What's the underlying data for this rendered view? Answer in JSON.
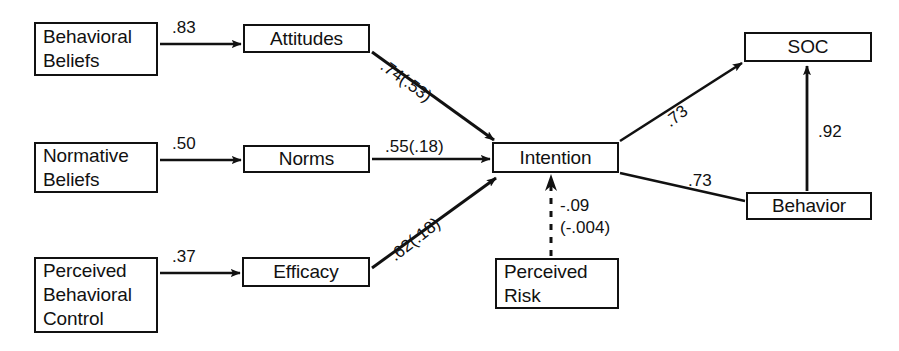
{
  "diagram": {
    "type": "path-diagram",
    "stroke_color": "#111111",
    "background_color": "#ffffff",
    "nodes": [
      {
        "id": "behavioral-beliefs",
        "lines": [
          "Behavioral",
          "Beliefs"
        ],
        "x": 34,
        "y": 22,
        "w": 124,
        "h": 54,
        "align": "left"
      },
      {
        "id": "normative-beliefs",
        "lines": [
          "Normative",
          "Beliefs"
        ],
        "x": 34,
        "y": 142,
        "w": 124,
        "h": 51,
        "align": "left"
      },
      {
        "id": "perceived-behavioral-control",
        "lines": [
          "Perceived",
          "Behavioral",
          "Control"
        ],
        "x": 34,
        "y": 257,
        "w": 124,
        "h": 76,
        "align": "left"
      },
      {
        "id": "attitudes",
        "lines": [
          "Attitudes"
        ],
        "x": 243,
        "y": 24,
        "w": 127,
        "h": 29,
        "align": "center"
      },
      {
        "id": "norms",
        "lines": [
          "Norms"
        ],
        "x": 243,
        "y": 145,
        "w": 127,
        "h": 28,
        "align": "center"
      },
      {
        "id": "efficacy",
        "lines": [
          "Efficacy"
        ],
        "x": 242,
        "y": 257,
        "w": 128,
        "h": 30,
        "align": "center"
      },
      {
        "id": "intention",
        "lines": [
          "Intention"
        ],
        "x": 492,
        "y": 142,
        "w": 127,
        "h": 31,
        "align": "center"
      },
      {
        "id": "perceived-risk",
        "lines": [
          "Perceived",
          "Risk"
        ],
        "x": 495,
        "y": 258,
        "w": 124,
        "h": 51,
        "align": "left"
      },
      {
        "id": "soc",
        "lines": [
          "SOC"
        ],
        "x": 744,
        "y": 32,
        "w": 128,
        "h": 30,
        "align": "center"
      },
      {
        "id": "behavior",
        "lines": [
          "Behavior"
        ],
        "x": 746,
        "y": 192,
        "w": 126,
        "h": 28,
        "align": "center"
      }
    ],
    "edges": [
      {
        "id": "behavioral-beliefs-to-attitudes",
        "from": "behavioral-beliefs",
        "to": "attitudes",
        "label": ".83",
        "style": "solid",
        "arrow": true
      },
      {
        "id": "normative-beliefs-to-norms",
        "from": "normative-beliefs",
        "to": "norms",
        "label": ".50",
        "style": "solid",
        "arrow": true
      },
      {
        "id": "perceived-behavioral-control-to-efficacy",
        "from": "perceived-behavioral-control",
        "to": "efficacy",
        "label": ".37",
        "style": "solid",
        "arrow": true
      },
      {
        "id": "attitudes-to-intention",
        "from": "attitudes",
        "to": "intention",
        "label": ".74(.53)",
        "style": "solid",
        "arrow": true
      },
      {
        "id": "norms-to-intention",
        "from": "norms",
        "to": "intention",
        "label": ".55(.18)",
        "style": "solid",
        "arrow": true
      },
      {
        "id": "efficacy-to-intention",
        "from": "efficacy",
        "to": "intention",
        "label": ".62(.18)",
        "style": "solid",
        "arrow": true
      },
      {
        "id": "perceived-risk-to-intention",
        "from": "perceived-risk",
        "to": "intention",
        "label": "-.09",
        "label2": "(-.004)",
        "style": "dashed",
        "arrow": true
      },
      {
        "id": "intention-to-soc",
        "from": "intention",
        "to": "soc",
        "label": ".73",
        "style": "solid",
        "arrow": true
      },
      {
        "id": "intention-to-behavior",
        "from": "intention",
        "to": "behavior",
        "label": ".73",
        "style": "solid",
        "arrow": false
      },
      {
        "id": "behavior-to-soc",
        "from": "behavior",
        "to": "soc",
        "label": ".92",
        "style": "solid",
        "arrow": true
      }
    ]
  },
  "labels": {
    "behavioral_beliefs_line1": "Behavioral",
    "behavioral_beliefs_line2": "Beliefs",
    "normative_beliefs_line1": "Normative",
    "normative_beliefs_line2": "Beliefs",
    "pbc_line1": "Perceived",
    "pbc_line2": "Behavioral",
    "pbc_line3": "Control",
    "attitudes": "Attitudes",
    "norms": "Norms",
    "efficacy": "Efficacy",
    "intention": "Intention",
    "perceived_risk_line1": "Perceived",
    "perceived_risk_line2": "Risk",
    "soc": "SOC",
    "behavior": "Behavior",
    "coef_bb_attitudes": ".83",
    "coef_nb_norms": ".50",
    "coef_pbc_efficacy": ".37",
    "coef_attitudes_intention": ".74(.53)",
    "coef_norms_intention": ".55(.18)",
    "coef_efficacy_intention": ".62(.18)",
    "coef_risk_intention_1": "-.09",
    "coef_risk_intention_2": "(-.004)",
    "coef_intention_soc": ".73",
    "coef_intention_behavior": ".73",
    "coef_behavior_soc": ".92"
  }
}
